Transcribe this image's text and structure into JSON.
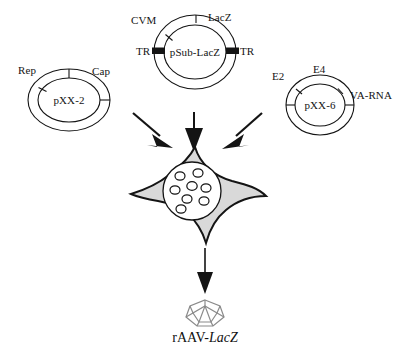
{
  "figure": {
    "caption_prefix": "rAAV-",
    "caption_italic": "LacZ",
    "caption_full": "rAAV-LacZ",
    "background_color": "#ffffff",
    "ink_color": "#141414",
    "cell_fill_color": "#d9d9d9",
    "capsid_color": "#8a8a8a"
  },
  "plasmids": [
    {
      "id": "pxx2",
      "name": "pXX-2",
      "genes": [
        {
          "label": "Rep"
        },
        {
          "label": "Cap"
        }
      ]
    },
    {
      "id": "psublacz",
      "name": "pSub-LacZ",
      "genes": [
        {
          "label": "CVM"
        },
        {
          "label": "LacZ"
        },
        {
          "label": "TR"
        },
        {
          "label": "TR"
        }
      ]
    },
    {
      "id": "pxx6",
      "name": "pXX-6",
      "genes": [
        {
          "label": "E2"
        },
        {
          "label": "E4"
        },
        {
          "label": "VA-RNA"
        }
      ]
    }
  ],
  "cell": {
    "name": "transfected-cell",
    "nucleus_particle_count": 8
  },
  "arrows": {
    "left_label": "",
    "center_label": "",
    "right_label": "",
    "output_label": ""
  },
  "capsid": {
    "name": "rAAV virion"
  }
}
